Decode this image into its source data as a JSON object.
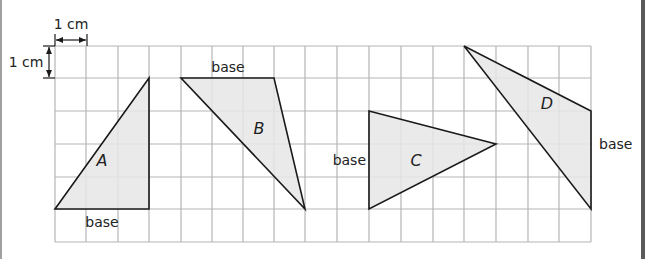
{
  "diagram": {
    "colors": {
      "grid_line": "#b5b5b5",
      "triangle_fill": "#e6e6e6",
      "triangle_stroke": "#1a1a1a",
      "text": "#222222"
    },
    "grid": {
      "columns": 17,
      "rows": 6,
      "cell_size_label": "1 cm",
      "x_lines": [
        55,
        86,
        118,
        149,
        181,
        212,
        243,
        274,
        305,
        337,
        369,
        401,
        433,
        464,
        496,
        528,
        559,
        591
      ],
      "y_lines": [
        46,
        78,
        111,
        144,
        177,
        209,
        242
      ]
    },
    "scale_markers": {
      "horizontal": {
        "label": "1 cm",
        "x1": 55,
        "x2": 87,
        "y": 40,
        "label_x": 71,
        "label_y": 29
      },
      "vertical": {
        "label": "1 cm",
        "x": 49,
        "y1": 46,
        "y2": 78,
        "label_x": 26,
        "label_y": 67
      }
    },
    "triangles": [
      {
        "name": "A",
        "points": [
          [
            55,
            209
          ],
          [
            149,
            209
          ],
          [
            149,
            78
          ]
        ],
        "label": "A",
        "label_x": 102,
        "label_y": 166,
        "base_label": "base",
        "base_label_x": 102,
        "base_label_y": 227,
        "base_anchor": "middle"
      },
      {
        "name": "B",
        "points": [
          [
            181,
            78
          ],
          [
            274,
            78
          ],
          [
            305,
            209
          ]
        ],
        "label": "B",
        "label_x": 259,
        "label_y": 134,
        "base_label": "base",
        "base_label_x": 228,
        "base_label_y": 72,
        "base_anchor": "middle"
      },
      {
        "name": "C",
        "points": [
          [
            369,
            111
          ],
          [
            369,
            209
          ],
          [
            496,
            144
          ]
        ],
        "label": "C",
        "label_x": 416,
        "label_y": 166,
        "base_label": "base",
        "base_label_x": 366,
        "base_label_y": 165,
        "base_anchor": "end"
      },
      {
        "name": "D",
        "points": [
          [
            464,
            46
          ],
          [
            591,
            111
          ],
          [
            591,
            209
          ]
        ],
        "label": "D",
        "label_x": 547,
        "label_y": 109,
        "base_label": "base",
        "base_label_x": 599,
        "base_label_y": 149,
        "base_anchor": "start"
      }
    ]
  }
}
